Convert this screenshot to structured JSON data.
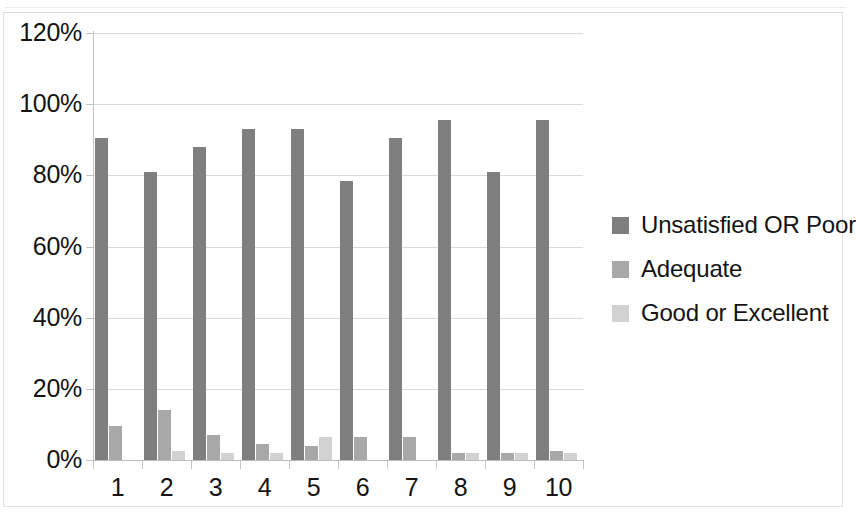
{
  "chart_data": {
    "type": "bar",
    "title": "",
    "subtitle": "",
    "xlabel": "",
    "ylabel": "",
    "categories": [
      "1",
      "2",
      "3",
      "4",
      "5",
      "6",
      "7",
      "8",
      "9",
      "10"
    ],
    "series": [
      {
        "name": "Unsatisfied OR Poor",
        "color": "#7f7f7f",
        "values": [
          90.5,
          81.0,
          88.0,
          93.0,
          93.0,
          78.5,
          90.5,
          95.5,
          81.0,
          95.5
        ]
      },
      {
        "name": "Adequate",
        "color": "#a8a8a8",
        "values": [
          9.5,
          14.0,
          7.0,
          4.5,
          4.0,
          6.5,
          6.5,
          2.0,
          2.0,
          2.5
        ]
      },
      {
        "name": "Good or Excellent",
        "color": "#d2d2d2",
        "values": [
          0.0,
          2.5,
          2.0,
          2.0,
          6.5,
          0.0,
          0.0,
          2.0,
          2.0,
          2.0
        ]
      }
    ],
    "ylim": [
      0,
      120
    ],
    "ytick_values": [
      0,
      20,
      40,
      60,
      80,
      100,
      120
    ],
    "ytick_labels": [
      "0%",
      "20%",
      "40%",
      "60%",
      "80%",
      "100%",
      "120%"
    ],
    "grid": true,
    "legend_position": "right",
    "value_suffix": "%"
  }
}
